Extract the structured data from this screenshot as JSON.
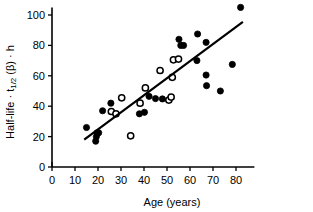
{
  "chart_data": {
    "type": "scatter",
    "title": "",
    "subtitle": "",
    "xlabel": "Age  (years)",
    "ylabel": "Half-life · t1/2 (β) · h",
    "ylabel_parts": {
      "prefix": "Half-life · t",
      "subscript": "1/2",
      "middle": " (β) · h"
    },
    "xlim": [
      0,
      88
    ],
    "ylim": [
      0,
      105
    ],
    "xticks": [
      0,
      10,
      20,
      30,
      40,
      50,
      60,
      70,
      80
    ],
    "yticks": [
      0,
      20,
      40,
      60,
      80,
      100
    ],
    "xtick_labels": [
      "0",
      "10",
      "20",
      "30",
      "40",
      "50",
      "60",
      "70",
      "80"
    ],
    "ytick_labels": [
      "0",
      "20",
      "40",
      "60",
      "80",
      "100"
    ],
    "grid": false,
    "legend": "none",
    "marker_size": 3.1,
    "colors": {
      "axis": "#000000",
      "filled_marker": "#000000",
      "open_marker": "#ffffff",
      "fit_line": "#000000"
    },
    "series": [
      {
        "name": "filled circles",
        "marker": "filled-circle",
        "points": [
          [
            15.0,
            26.0
          ],
          [
            19.0,
            17.0
          ],
          [
            19.3,
            20.0
          ],
          [
            19.6,
            22.5
          ],
          [
            20.3,
            22.5
          ],
          [
            22.0,
            37.0
          ],
          [
            25.6,
            42.0
          ],
          [
            38.0,
            35.0
          ],
          [
            40.2,
            36.0
          ],
          [
            42.2,
            46.5
          ],
          [
            45.0,
            45.0
          ],
          [
            48.0,
            44.8
          ],
          [
            55.2,
            84.0
          ],
          [
            56.0,
            80.0
          ],
          [
            57.2,
            80.0
          ],
          [
            63.3,
            87.5
          ],
          [
            63.0,
            70.0
          ],
          [
            67.0,
            82.0
          ],
          [
            67.0,
            60.5
          ],
          [
            67.2,
            53.5
          ],
          [
            73.2,
            50.0
          ],
          [
            78.4,
            67.5
          ],
          [
            82.0,
            105.0
          ]
        ]
      },
      {
        "name": "open circles",
        "marker": "open-circle",
        "points": [
          [
            25.8,
            36.5
          ],
          [
            27.8,
            35.0
          ],
          [
            30.3,
            45.5
          ],
          [
            34.2,
            20.5
          ],
          [
            38.3,
            42.0
          ],
          [
            40.6,
            52.0
          ],
          [
            47.0,
            63.5
          ],
          [
            50.8,
            44.0
          ],
          [
            51.8,
            46.0
          ],
          [
            52.3,
            59.0
          ],
          [
            52.8,
            70.5
          ],
          [
            55.0,
            71.0
          ]
        ]
      }
    ],
    "fit_line": {
      "name": "regression line",
      "x_start": 14.0,
      "y_start": 18.0,
      "x_end": 83.0,
      "y_end": 95.5
    }
  }
}
